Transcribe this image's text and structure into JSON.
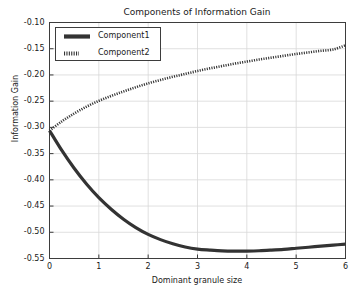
{
  "chart_data": {
    "type": "line",
    "title": "Components of Information Gain",
    "xlabel": "Dominant granule size",
    "ylabel": "Information Gain",
    "xlim": [
      0,
      6
    ],
    "ylim": [
      -0.55,
      -0.1
    ],
    "grid": true,
    "legend_position": "upper left",
    "xticks": [
      "0",
      "1",
      "2",
      "3",
      "4",
      "5",
      "6"
    ],
    "yticks": [
      "-0.10",
      "-0.15",
      "-0.20",
      "-0.25",
      "-0.30",
      "-0.35",
      "-0.40",
      "-0.45",
      "-0.50",
      "-0.55"
    ],
    "xtick_values": [
      0,
      1,
      2,
      3,
      4,
      5,
      6
    ],
    "ytick_values": [
      -0.1,
      -0.15,
      -0.2,
      -0.25,
      -0.3,
      -0.35,
      -0.4,
      -0.45,
      -0.5,
      -0.55
    ],
    "x": [
      0,
      0.25,
      0.5,
      0.75,
      1,
      1.25,
      1.5,
      1.75,
      2,
      2.25,
      2.5,
      2.75,
      3,
      3.25,
      3.5,
      3.75,
      4,
      4.25,
      4.5,
      4.75,
      5,
      5.25,
      5.5,
      5.75,
      6
    ],
    "series": [
      {
        "name": "Component1",
        "style": "solid",
        "color": "#333333",
        "linewidth": 3.2,
        "values": [
          -0.306,
          -0.344,
          -0.378,
          -0.408,
          -0.434,
          -0.456,
          -0.475,
          -0.491,
          -0.504,
          -0.514,
          -0.522,
          -0.528,
          -0.532,
          -0.534,
          -0.5355,
          -0.536,
          -0.5358,
          -0.5352,
          -0.534,
          -0.5325,
          -0.5305,
          -0.5285,
          -0.5265,
          -0.5245,
          -0.5225
        ]
      },
      {
        "name": "Component2",
        "style": "dotted",
        "color": "#333333",
        "linewidth": 2.6,
        "values": [
          -0.306,
          -0.2885,
          -0.2735,
          -0.2605,
          -0.2495,
          -0.24,
          -0.2315,
          -0.2235,
          -0.216,
          -0.2095,
          -0.2035,
          -0.198,
          -0.1925,
          -0.1875,
          -0.183,
          -0.1785,
          -0.1745,
          -0.1705,
          -0.167,
          -0.1635,
          -0.16,
          -0.157,
          -0.154,
          -0.1515,
          -0.1435
        ]
      }
    ]
  },
  "legend": {
    "entries": [
      {
        "label": "Component1"
      },
      {
        "label": "Component2"
      }
    ]
  }
}
